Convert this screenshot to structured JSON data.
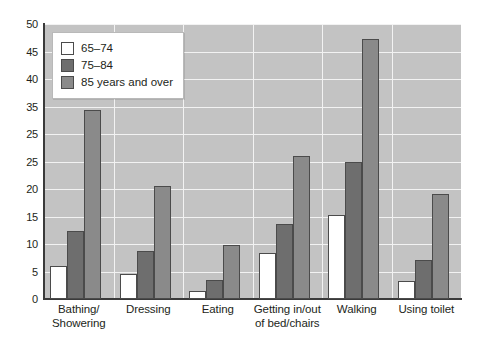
{
  "chart_data": {
    "type": "bar",
    "title": "",
    "xlabel": "",
    "ylabel": "",
    "ylim": [
      0,
      50
    ],
    "grid": true,
    "legend_position": "top-left-inside",
    "categories": [
      "Bathing/\nShowering",
      "Dressing",
      "Eating",
      "Getting in/out\nof bed/chairs",
      "Walking",
      "Using toilet"
    ],
    "category_lines": [
      [
        "Bathing/",
        "Showering"
      ],
      [
        "Dressing"
      ],
      [
        "Eating"
      ],
      [
        "Getting in/out",
        "of bed/chairs"
      ],
      [
        "Walking"
      ],
      [
        "Using toilet"
      ]
    ],
    "series": [
      {
        "name": "65–74",
        "color": "#ffffff",
        "values": [
          6.0,
          4.6,
          1.5,
          8.4,
          15.3,
          3.3
        ]
      },
      {
        "name": "75–84",
        "color": "#6e6e6e",
        "values": [
          12.3,
          8.8,
          3.4,
          13.6,
          24.9,
          7.1
        ]
      },
      {
        "name": "85 years and over",
        "color": "#8a8a8a",
        "values": [
          34.3,
          20.5,
          9.9,
          26.0,
          47.3,
          19.1
        ]
      }
    ],
    "y_ticks": [
      {
        "value": 50,
        "label": "50"
      },
      {
        "value": 45,
        "label": "45"
      },
      {
        "value": 40,
        "label": "40"
      },
      {
        "value": 35,
        "label": "35"
      },
      {
        "value": 30,
        "label": "25"
      },
      {
        "value": 25,
        "label": "25"
      },
      {
        "value": 20,
        "label": "20"
      },
      {
        "value": 15,
        "label": "15"
      },
      {
        "value": 10,
        "label": "10"
      },
      {
        "value": 5,
        "label": "5"
      },
      {
        "value": 0,
        "label": "0"
      }
    ]
  },
  "legend": {
    "items": [
      {
        "label": "65–74"
      },
      {
        "label": "75–84"
      },
      {
        "label": "85 years and over"
      }
    ]
  },
  "colors": {
    "plot_background": "#c3c3c3",
    "gridline": "#f2f2f2",
    "axis": "#3a3a3a",
    "bar_outline": "#4b4b4b",
    "text": "#231f20",
    "page_background": "#ffffff"
  }
}
